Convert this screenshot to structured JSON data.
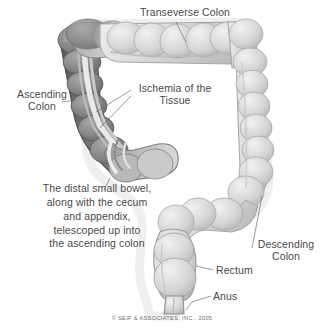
{
  "illustration": {
    "subject": "intussusception-of-large-intestine",
    "background_color": "#ffffff",
    "text_color": "#4a4a4a",
    "ischemic_color": "#6f6f6f",
    "normal_colon_color": "#d8d8d8"
  },
  "labels": {
    "transverse_colon": "Transeverse Colon",
    "ascending_colon": "Ascending\nColon",
    "ischemia": "Ischemia of the\nTissue",
    "caption": "The distal small bowel,\nalong with the cecum\nand appendix,\ntelescoped up into\nthe ascending colon",
    "descending_colon": "Descending\nColon",
    "rectum": "Rectum",
    "anus": "Anus"
  },
  "footer": {
    "copyright": "© SEIF & ASSOCIATES, INC., 2005"
  }
}
